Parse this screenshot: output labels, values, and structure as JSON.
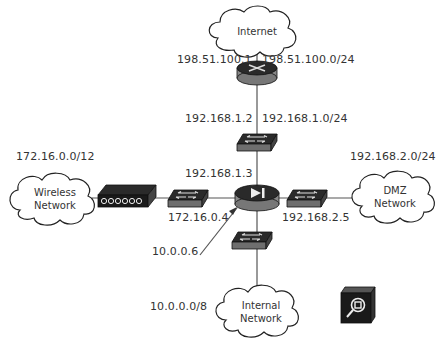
{
  "clouds": {
    "internet": {
      "label": "Internet"
    },
    "wireless": {
      "line1": "Wireless",
      "line2": "Network"
    },
    "dmz": {
      "line1": "DMZ",
      "line2": "Network"
    },
    "internal": {
      "line1": "Internal",
      "line2": "Network"
    }
  },
  "labels": {
    "router_wan_ip": "198.51.100.1",
    "wan_subnet": "198.51.100.0/24",
    "router_lan_ip": "192.168.1.2",
    "lan_subnet": "192.168.1.0/24",
    "firewall_lan_ip": "192.168.1.3",
    "wireless_subnet": "172.16.0.0/12",
    "firewall_wireless_ip": "172.16.0.4",
    "dmz_subnet": "192.168.2.0/24",
    "firewall_dmz_ip": "192.168.2.5",
    "firewall_internal_ip": "10.0.0.6",
    "internal_subnet": "10.0.0.0/8"
  },
  "devices": [
    "router",
    "switch-upper",
    "firewall",
    "switch-left",
    "switch-right",
    "switch-lower",
    "wireless-access-point",
    "ids-sensor"
  ],
  "colors": {
    "line": "#555555",
    "device_top": "#2a2a2a",
    "device_side": "#808080",
    "cloud_stroke": "#222222"
  }
}
